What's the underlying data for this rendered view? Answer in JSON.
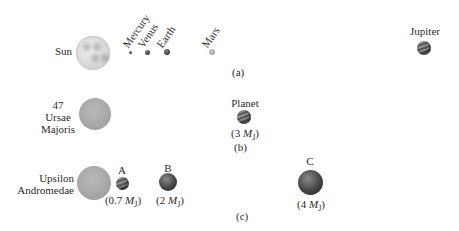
{
  "panel_a": {
    "label": "(a)",
    "star": "Sun",
    "planets": [
      "Mercury",
      "Venus",
      "Earth",
      "Mars",
      "Jupiter"
    ]
  },
  "panel_b": {
    "label": "(b)",
    "star_line1": "47",
    "star_line2": "Ursae",
    "star_line3": "Majoris",
    "planet_name": "Planet",
    "planet_mass_value": "(3",
    "planet_mass_unit": "M",
    "planet_mass_sub": "J",
    "planet_mass_close": ")"
  },
  "panel_c": {
    "label": "(c)",
    "star_line1": "Upsilon",
    "star_line2": "Andromedae",
    "planets": [
      {
        "name": "A",
        "mass_value": "(0.7",
        "unit": "M",
        "sub": "J",
        "close": ")"
      },
      {
        "name": "B",
        "mass_value": "(2",
        "unit": "M",
        "sub": "J",
        "close": ")"
      },
      {
        "name": "C",
        "mass_value": "(4",
        "unit": "M",
        "sub": "J",
        "close": ")"
      }
    ]
  }
}
